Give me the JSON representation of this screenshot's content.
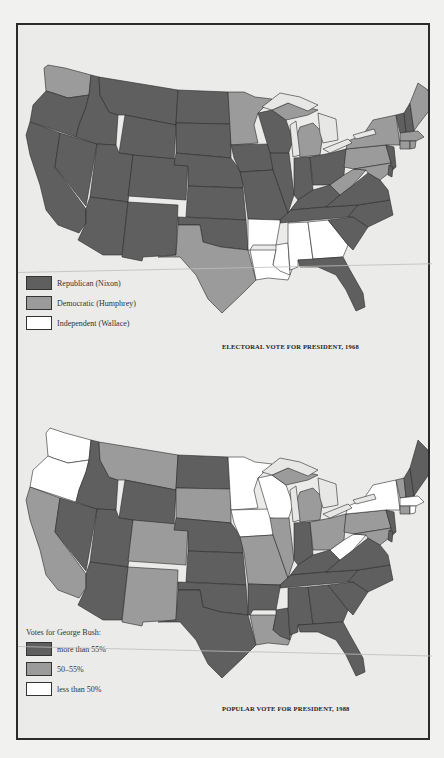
{
  "colors": {
    "republican_or_high": "#5f5f5f",
    "democratic_or_mid": "#9b9b9b",
    "independent_or_low": "#ffffff",
    "background": "#ebebea",
    "border": "#2b2b2b"
  },
  "map_1968": {
    "caption": "ELECTORAL VOTE FOR PRESIDENT, 1968",
    "legend": [
      {
        "label": "Republican (Nixon)",
        "category": "republican"
      },
      {
        "label": "Democratic (Humphrey)",
        "category": "democratic"
      },
      {
        "label": "Independent (Wallace)",
        "category": "independent"
      }
    ],
    "states": {
      "republican": [
        "OR",
        "CA",
        "NV",
        "ID",
        "MT",
        "WY",
        "UT",
        "AZ",
        "CO",
        "NM",
        "ND",
        "SD",
        "NE",
        "KS",
        "OK",
        "IA",
        "MO",
        "WI",
        "IL",
        "IN",
        "OH",
        "KY",
        "TN",
        "VA",
        "NC",
        "SC",
        "FL",
        "NJ",
        "DE",
        "VT",
        "NH",
        "AK"
      ],
      "democratic": [
        "WA",
        "MN",
        "TX",
        "MI",
        "WV",
        "PA",
        "NY",
        "MD",
        "CT",
        "RI",
        "MA",
        "ME"
      ],
      "independent": [
        "AR",
        "LA",
        "MS",
        "AL",
        "GA"
      ]
    }
  },
  "map_1988": {
    "caption": "POPULAR VOTE FOR PRESIDENT, 1988",
    "legend_title": "Votes for George Bush:",
    "legend": [
      {
        "label": "more than 55%",
        "category": "high"
      },
      {
        "label": "50–55%",
        "category": "mid"
      },
      {
        "label": "less than 50%",
        "category": "low"
      }
    ],
    "states": {
      "high": [
        "ID",
        "NV",
        "UT",
        "AZ",
        "WY",
        "ND",
        "NE",
        "KS",
        "OK",
        "TX",
        "AR",
        "MS",
        "AL",
        "GA",
        "FL",
        "SC",
        "NC",
        "TN",
        "KY",
        "VA",
        "IN",
        "NH",
        "ME",
        "NJ",
        "DE"
      ],
      "mid": [
        "CA",
        "MT",
        "SD",
        "CO",
        "NM",
        "MO",
        "IL",
        "MI",
        "OH",
        "PA",
        "LA",
        "VT",
        "CT",
        "MD"
      ],
      "low": [
        "WA",
        "OR",
        "MN",
        "IA",
        "WI",
        "WV",
        "NY",
        "MA",
        "RI"
      ]
    }
  }
}
